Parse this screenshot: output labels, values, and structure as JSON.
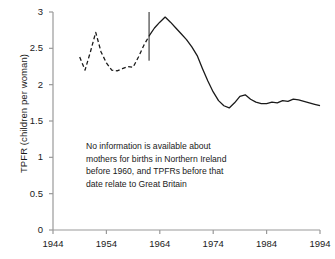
{
  "chart_data": {
    "type": "line",
    "title": "",
    "xlabel": "",
    "ylabel": "TPFR (children per woman)",
    "xlim": [
      1944,
      1994
    ],
    "ylim": [
      0,
      3
    ],
    "ytick_labels": [
      "0",
      "0.5",
      "1",
      "1.5",
      "2",
      "2.5",
      "3"
    ],
    "ytick_values": [
      0,
      0.5,
      1,
      1.5,
      2,
      2.5,
      3
    ],
    "xtick_labels": [
      "1944",
      "1954",
      "1964",
      "1974",
      "1984",
      "1994"
    ],
    "xtick_values": [
      1944,
      1954,
      1964,
      1974,
      1984,
      1994
    ],
    "grid": false,
    "legend": "none",
    "annotations": [
      {
        "name": "data-source-note",
        "lines": [
          "No information is available about",
          "mothers for births in Northern Ireland",
          "before 1960, and TPFRs before that",
          "date relate to Great Britain"
        ],
        "x": 1957,
        "y": 1.0
      },
      {
        "name": "series-break-divider",
        "type": "vertical-rule",
        "x": 1962,
        "y_from": 2.33,
        "y_to": 3.0,
        "color": "#808080"
      }
    ],
    "series": [
      {
        "name": "TPFR (Great Britain, pre-1960)",
        "style": "dashed",
        "color": "#1a1a1a",
        "x": [
          1949,
          1950,
          1951,
          1952,
          1953,
          1954,
          1955,
          1956,
          1957,
          1958,
          1959,
          1960,
          1961,
          1962
        ],
        "values": [
          2.38,
          2.2,
          2.45,
          2.72,
          2.45,
          2.3,
          2.2,
          2.19,
          2.22,
          2.25,
          2.24,
          2.38,
          2.54,
          2.67
        ]
      },
      {
        "name": "TPFR (Northern Ireland, 1960 onwards)",
        "style": "solid",
        "color": "#1a1a1a",
        "x": [
          1962,
          1963,
          1964,
          1965,
          1966,
          1967,
          1968,
          1969,
          1970,
          1971,
          1972,
          1973,
          1974,
          1975,
          1976,
          1977,
          1978,
          1979,
          1980,
          1981,
          1982,
          1983,
          1984,
          1985,
          1986,
          1987,
          1988,
          1989,
          1990,
          1991,
          1992,
          1993,
          1994
        ],
        "values": [
          2.67,
          2.78,
          2.86,
          2.93,
          2.86,
          2.78,
          2.7,
          2.62,
          2.52,
          2.4,
          2.22,
          2.05,
          1.9,
          1.78,
          1.71,
          1.68,
          1.75,
          1.84,
          1.86,
          1.8,
          1.76,
          1.74,
          1.74,
          1.76,
          1.75,
          1.78,
          1.77,
          1.8,
          1.79,
          1.77,
          1.75,
          1.73,
          1.71
        ]
      }
    ]
  },
  "axis": {
    "line_color": "#999999",
    "text_color": "#1a1a1a"
  }
}
